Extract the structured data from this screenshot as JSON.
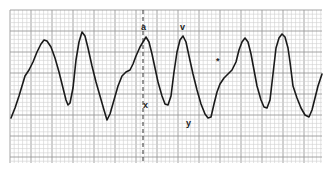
{
  "figure": {
    "type": "jugular-venous-pulse-tracing",
    "grid": {
      "left": 10,
      "top": 10,
      "right": 322,
      "bottom": 163,
      "minor_step": 4.2,
      "major_every": 5,
      "minor_color": "#cfcfcf",
      "major_color": "#9a9a9a",
      "background": "#ffffff"
    },
    "waveform": {
      "color": "#1a1a1a",
      "stroke_width": 1.6,
      "points": [
        [
          11,
          118
        ],
        [
          15,
          108
        ],
        [
          19,
          96
        ],
        [
          22,
          86
        ],
        [
          25,
          76
        ],
        [
          29,
          70
        ],
        [
          33,
          62
        ],
        [
          37,
          52
        ],
        [
          41,
          44
        ],
        [
          44,
          40
        ],
        [
          47,
          41
        ],
        [
          51,
          47
        ],
        [
          55,
          58
        ],
        [
          59,
          72
        ],
        [
          63,
          88
        ],
        [
          66,
          100
        ],
        [
          68,
          105
        ],
        [
          70,
          103
        ],
        [
          73,
          88
        ],
        [
          76,
          60
        ],
        [
          79,
          42
        ],
        [
          82,
          32
        ],
        [
          85,
          36
        ],
        [
          88,
          48
        ],
        [
          92,
          66
        ],
        [
          96,
          82
        ],
        [
          100,
          96
        ],
        [
          104,
          110
        ],
        [
          107,
          120
        ],
        [
          110,
          114
        ],
        [
          114,
          100
        ],
        [
          118,
          86
        ],
        [
          122,
          76
        ],
        [
          126,
          72
        ],
        [
          130,
          70
        ],
        [
          133,
          64
        ],
        [
          136,
          56
        ],
        [
          140,
          47
        ],
        [
          143,
          42
        ],
        [
          146,
          37
        ],
        [
          149,
          42
        ],
        [
          152,
          54
        ],
        [
          155,
          68
        ],
        [
          158,
          82
        ],
        [
          162,
          96
        ],
        [
          165,
          104
        ],
        [
          168,
          105
        ],
        [
          171,
          96
        ],
        [
          174,
          72
        ],
        [
          177,
          52
        ],
        [
          180,
          40
        ],
        [
          183,
          36
        ],
        [
          186,
          42
        ],
        [
          189,
          56
        ],
        [
          193,
          74
        ],
        [
          197,
          90
        ],
        [
          201,
          104
        ],
        [
          205,
          114
        ],
        [
          208,
          118
        ],
        [
          211,
          117
        ],
        [
          214,
          104
        ],
        [
          217,
          92
        ],
        [
          220,
          84
        ],
        [
          224,
          78
        ],
        [
          228,
          74
        ],
        [
          232,
          70
        ],
        [
          236,
          62
        ],
        [
          239,
          50
        ],
        [
          242,
          42
        ],
        [
          245,
          38
        ],
        [
          248,
          42
        ],
        [
          251,
          54
        ],
        [
          254,
          70
        ],
        [
          257,
          86
        ],
        [
          261,
          100
        ],
        [
          264,
          107
        ],
        [
          267,
          108
        ],
        [
          270,
          100
        ],
        [
          273,
          74
        ],
        [
          276,
          48
        ],
        [
          279,
          38
        ],
        [
          282,
          34
        ],
        [
          285,
          37
        ],
        [
          288,
          48
        ],
        [
          290,
          62
        ],
        [
          293,
          86
        ],
        [
          297,
          98
        ],
        [
          301,
          108
        ],
        [
          305,
          115
        ],
        [
          309,
          117
        ],
        [
          312,
          110
        ],
        [
          315,
          98
        ],
        [
          318,
          86
        ],
        [
          322,
          74
        ]
      ]
    },
    "reference_line": {
      "x": 143,
      "y1": 10,
      "y2": 163,
      "style": "dashed",
      "color": "#333333"
    },
    "labels": [
      {
        "id": "a",
        "text": "a",
        "x": 141,
        "y": 23
      },
      {
        "id": "v",
        "text": "v",
        "x": 180,
        "y": 23
      },
      {
        "id": "x",
        "text": "x",
        "x": 143,
        "y": 101
      },
      {
        "id": "y",
        "text": "y",
        "x": 186,
        "y": 119
      },
      {
        "id": "star",
        "text": "*",
        "x": 216,
        "y": 57
      }
    ]
  }
}
